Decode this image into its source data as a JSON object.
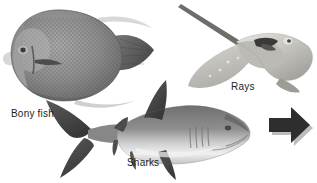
{
  "figure": {
    "background_color": "#ffffff",
    "width": 317,
    "height": 183,
    "caption_font_size": 10,
    "caption_color": "#1d1d1d"
  },
  "specimens": [
    {
      "id": "bony-fish",
      "label": "Bony fish",
      "icon": "angelfish-photo",
      "description": "oval disc-shaped speckled angelfish facing left with fan tail at right",
      "body_color": "#8a8a8a",
      "shade_color": "#6e6e6e",
      "highlight_color": "#b4b4b4"
    },
    {
      "id": "rays",
      "label": "Rays",
      "icon": "stingray-photo",
      "description": "pale wing-shaped ray with thin whip tail extending to upper left",
      "body_color": "#c9c7c2",
      "shade_color": "#a5a39e",
      "highlight_color": "#e3e1dc"
    },
    {
      "id": "sharks",
      "label": "Sharks",
      "icon": "shark-photo",
      "description": "grey reef shark facing right with pale underside and dark fins",
      "body_color": "#8d8d8d",
      "shade_color": "#5d5d5d",
      "highlight_color": "#ededed"
    }
  ],
  "arrow": {
    "icon": "right-arrow-icon",
    "direction": "right",
    "color": "#2e2e2e",
    "shadow_color": "#bdbdbd"
  }
}
